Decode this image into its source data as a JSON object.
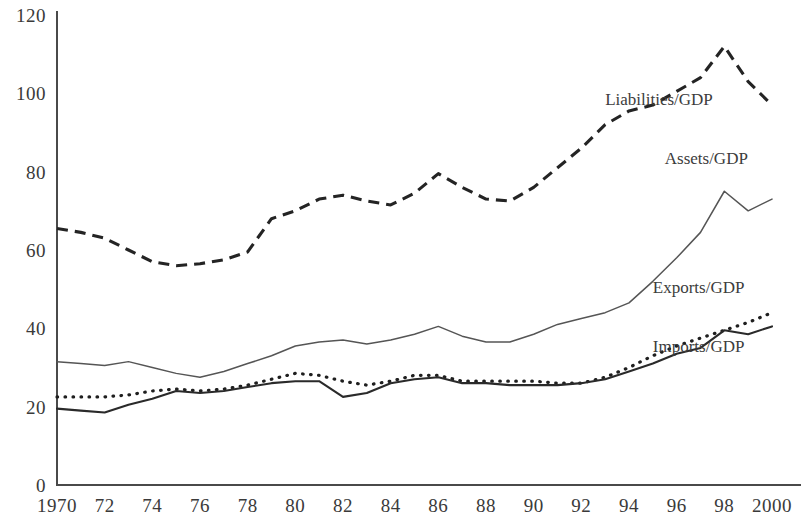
{
  "chart_data": {
    "type": "line",
    "title": "",
    "subtitle": "",
    "xlabel": "",
    "ylabel": "",
    "xlim": [
      1970,
      2000
    ],
    "ylim": [
      0,
      120
    ],
    "grid": false,
    "legend_position": "inline-right",
    "x": [
      1970,
      1971,
      1972,
      1973,
      1974,
      1975,
      1976,
      1977,
      1978,
      1979,
      1980,
      1981,
      1982,
      1983,
      1984,
      1985,
      1986,
      1987,
      1988,
      1989,
      1990,
      1991,
      1992,
      1993,
      1994,
      1995,
      1996,
      1997,
      1998,
      1999,
      2000
    ],
    "x_tick_labels": [
      "1970",
      "72",
      "74",
      "76",
      "78",
      "80",
      "82",
      "84",
      "86",
      "88",
      "90",
      "92",
      "94",
      "96",
      "98",
      "2000"
    ],
    "x_tick_values": [
      1970,
      1972,
      1974,
      1976,
      1978,
      1980,
      1982,
      1984,
      1986,
      1988,
      1990,
      1992,
      1994,
      1996,
      1998,
      2000
    ],
    "y_tick_labels": [
      "0",
      "20",
      "40",
      "60",
      "80",
      "100",
      "120"
    ],
    "y_tick_values": [
      0,
      20,
      40,
      60,
      80,
      100,
      120
    ],
    "series": [
      {
        "name": "Liabilities/GDP",
        "style": "dashed",
        "label_x": 1993.0,
        "label_y": 97,
        "values": [
          65.5,
          64.5,
          63.0,
          60.0,
          57.0,
          56.0,
          56.5,
          57.5,
          59.5,
          68.0,
          70.0,
          73.0,
          74.0,
          72.5,
          71.5,
          74.5,
          79.5,
          76.0,
          73.0,
          72.5,
          76.0,
          81.0,
          86.0,
          92.0,
          95.5,
          97.0,
          100.5,
          104.0,
          112.0,
          103.0,
          97.0
        ]
      },
      {
        "name": "Assets/GDP",
        "style": "solid-thin",
        "label_x": 1995.5,
        "label_y": 82,
        "values": [
          31.5,
          31.0,
          30.5,
          31.5,
          30.0,
          28.5,
          27.5,
          29.0,
          31.0,
          33.0,
          35.5,
          36.5,
          37.0,
          36.0,
          37.0,
          38.5,
          40.5,
          38.0,
          36.5,
          36.5,
          38.5,
          41.0,
          42.5,
          44.0,
          46.5,
          52.0,
          58.0,
          64.5,
          75.0,
          70.0,
          73.0
        ]
      },
      {
        "name": "Exports/GDP",
        "style": "dotted",
        "label_x": 1995.0,
        "label_y": 49,
        "values": [
          22.5,
          22.5,
          22.5,
          23.0,
          24.0,
          24.5,
          24.0,
          24.5,
          25.5,
          27.0,
          28.5,
          28.0,
          26.5,
          25.5,
          26.5,
          28.0,
          28.0,
          26.5,
          26.5,
          26.5,
          26.5,
          26.0,
          26.0,
          27.5,
          30.0,
          33.0,
          35.5,
          37.5,
          39.5,
          41.5,
          44.0
        ]
      },
      {
        "name": "Imports/GDP",
        "style": "solid",
        "label_x": 1995.0,
        "label_y": 34,
        "values": [
          19.5,
          19.0,
          18.5,
          20.5,
          22.0,
          24.0,
          23.5,
          24.0,
          25.0,
          26.0,
          26.5,
          26.5,
          22.5,
          23.5,
          26.0,
          27.0,
          27.5,
          26.0,
          26.0,
          25.5,
          25.5,
          25.5,
          26.0,
          27.0,
          29.0,
          31.0,
          33.5,
          35.0,
          39.5,
          38.5,
          40.5
        ]
      }
    ]
  }
}
